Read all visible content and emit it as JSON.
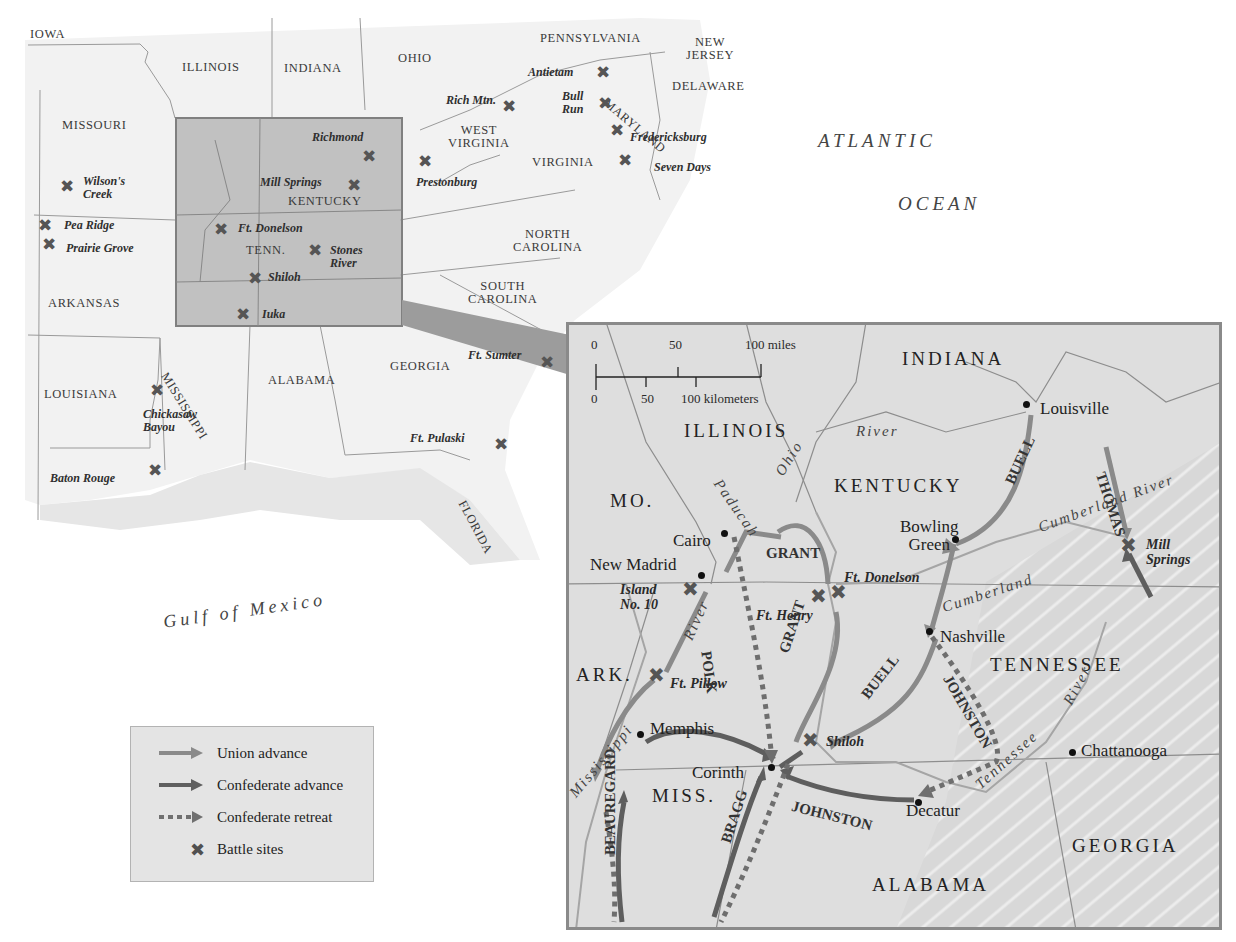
{
  "overview_map": {
    "states": [
      {
        "id": "iowa",
        "label": "IOWA",
        "x": 30,
        "y": 28
      },
      {
        "id": "illinois",
        "label": "ILLINOIS",
        "x": 182,
        "y": 61
      },
      {
        "id": "indiana",
        "label": "INDIANA",
        "x": 284,
        "y": 62
      },
      {
        "id": "ohio",
        "label": "OHIO",
        "x": 398,
        "y": 52
      },
      {
        "id": "pennsylvania",
        "label": "PENNSYLVANIA",
        "x": 540,
        "y": 32
      },
      {
        "id": "new-jersey",
        "label": "NEW\nJERSEY",
        "x": 686,
        "y": 36
      },
      {
        "id": "delaware",
        "label": "DELAWARE",
        "x": 672,
        "y": 80
      },
      {
        "id": "missouri",
        "label": "MISSOURI",
        "x": 62,
        "y": 119
      },
      {
        "id": "west-virginia",
        "label": "WEST\nVIRGINIA",
        "x": 448,
        "y": 124
      },
      {
        "id": "virginia",
        "label": "VIRGINIA",
        "x": 532,
        "y": 156
      },
      {
        "id": "kentucky",
        "label": "KENTUCKY",
        "x": 288,
        "y": 195
      },
      {
        "id": "tenn",
        "label": "TENN.",
        "x": 246,
        "y": 244
      },
      {
        "id": "north-carolina",
        "label": "NORTH\nCAROLINA",
        "x": 513,
        "y": 228
      },
      {
        "id": "south-carolina",
        "label": "SOUTH\nCAROLINA",
        "x": 468,
        "y": 280
      },
      {
        "id": "arkansas",
        "label": "ARKANSAS",
        "x": 48,
        "y": 297
      },
      {
        "id": "louisiana",
        "label": "LOUISIANA",
        "x": 44,
        "y": 388
      },
      {
        "id": "alabama",
        "label": "ALABAMA",
        "x": 268,
        "y": 374
      },
      {
        "id": "georgia",
        "label": "GEORGIA",
        "x": 390,
        "y": 360
      }
    ],
    "rotated_states": [
      {
        "id": "mississippi",
        "label": "MISSISSIPPI",
        "x": 170,
        "y": 370,
        "rotate": 58
      },
      {
        "id": "maryland",
        "label": "MARYLAND",
        "x": 610,
        "y": 96,
        "rotate": 40
      },
      {
        "id": "florida",
        "label": "FLORIDA",
        "x": 468,
        "y": 498,
        "rotate": 62
      }
    ],
    "battles": [
      {
        "label": "Antietam",
        "x": 528,
        "y": 66,
        "xx": 596,
        "xy": 64
      },
      {
        "label": "Rich Mtn.",
        "x": 446,
        "y": 94,
        "xx": 502,
        "xy": 98
      },
      {
        "label": "Bull\nRun",
        "x": 562,
        "y": 90,
        "xx": 598,
        "xy": 95
      },
      {
        "label": "Fredericksburg",
        "x": 630,
        "y": 131,
        "xx": 610,
        "xy": 122
      },
      {
        "label": "Seven Days",
        "x": 654,
        "y": 161,
        "xx": 618,
        "xy": 152
      },
      {
        "label": "Prestonburg",
        "x": 416,
        "y": 176,
        "xx": 418,
        "xy": 153
      },
      {
        "label": "Richmond",
        "x": 312,
        "y": 131,
        "xx": 362,
        "xy": 148
      },
      {
        "label": "Mill Springs",
        "x": 260,
        "y": 176,
        "xx": 347,
        "xy": 177
      },
      {
        "label": "Wilson's\nCreek",
        "x": 83,
        "y": 175,
        "xx": 60,
        "xy": 178
      },
      {
        "label": "Pea Ridge",
        "x": 64,
        "y": 219,
        "xx": 38,
        "xy": 217
      },
      {
        "label": "Prairie Grove",
        "x": 66,
        "y": 242,
        "xx": 42,
        "xy": 236
      },
      {
        "label": "Ft. Donelson",
        "x": 238,
        "y": 222,
        "xx": 214,
        "xy": 221
      },
      {
        "label": "Stones\nRiver",
        "x": 330,
        "y": 244,
        "xx": 308,
        "xy": 242
      },
      {
        "label": "Shiloh",
        "x": 268,
        "y": 271,
        "xx": 248,
        "xy": 270
      },
      {
        "label": "Iuka",
        "x": 262,
        "y": 308,
        "xx": 236,
        "xy": 306
      },
      {
        "label": "Ft. Sumter",
        "x": 468,
        "y": 349,
        "xx": 540,
        "xy": 354
      },
      {
        "label": "Chickasaw\nBayou",
        "x": 143,
        "y": 408,
        "xx": 150,
        "xy": 382
      },
      {
        "label": "Ft. Pulaski",
        "x": 410,
        "y": 432,
        "xx": 494,
        "xy": 436
      },
      {
        "label": "Baton Rouge",
        "x": 50,
        "y": 472,
        "xx": 148,
        "xy": 462
      }
    ],
    "oceans": [
      {
        "label": "ATLANTIC",
        "x": 818,
        "y": 130
      },
      {
        "label": "OCEAN",
        "x": 898,
        "y": 193
      }
    ],
    "gulf": {
      "label": "Gulf of Mexico"
    }
  },
  "legend": {
    "items": [
      {
        "type": "union",
        "label": "Union advance"
      },
      {
        "type": "confederate",
        "label": "Confederate advance"
      },
      {
        "type": "retreat",
        "label": "Confederate retreat"
      },
      {
        "type": "battle",
        "label": "Battle sites"
      }
    ]
  },
  "inset_map": {
    "scale": {
      "miles_ticks": [
        "0",
        "50",
        "100 miles"
      ],
      "km_ticks": [
        "0",
        "50",
        "100 kilometers"
      ]
    },
    "states": [
      {
        "label": "INDIANA",
        "x": 902,
        "y": 348
      },
      {
        "label": "ILLINOIS",
        "x": 684,
        "y": 420
      },
      {
        "label": "KENTUCKY",
        "x": 834,
        "y": 475
      },
      {
        "label": "MO.",
        "x": 610,
        "y": 490
      },
      {
        "label": "TENNESSEE",
        "x": 990,
        "y": 654
      },
      {
        "label": "ARK.",
        "x": 576,
        "y": 664
      },
      {
        "label": "MISS.",
        "x": 652,
        "y": 785
      },
      {
        "label": "ALABAMA",
        "x": 872,
        "y": 874
      },
      {
        "label": "GEORGIA",
        "x": 1072,
        "y": 835
      }
    ],
    "cities": [
      {
        "label": "Louisville",
        "x": 1040,
        "y": 400,
        "dx": 1026,
        "dy": 404
      },
      {
        "label": "Cairo",
        "x": 673,
        "y": 532,
        "dx": 724,
        "dy": 533
      },
      {
        "label": "Bowling\nGreen",
        "x": 900,
        "y": 518,
        "dx": 955,
        "dy": 539
      },
      {
        "label": "New Madrid",
        "x": 590,
        "y": 556,
        "dx": 701,
        "dy": 575
      },
      {
        "label": "Nashville",
        "x": 940,
        "y": 628,
        "dx": 929,
        "dy": 631
      },
      {
        "label": "Memphis",
        "x": 650,
        "y": 720,
        "dx": 640,
        "dy": 734
      },
      {
        "label": "Corinth",
        "x": 692,
        "y": 764,
        "dx": 771,
        "dy": 767
      },
      {
        "label": "Chattanooga",
        "x": 1081,
        "y": 742,
        "dx": 1072,
        "dy": 752
      },
      {
        "label": "Decatur",
        "x": 906,
        "y": 802,
        "dx": 918,
        "dy": 802
      }
    ],
    "battles": [
      {
        "label": "Mill\nSprings",
        "x": 1146,
        "y": 537,
        "xx": 1120,
        "xy": 537
      },
      {
        "label": "Island\nNo. 10",
        "x": 620,
        "y": 582,
        "xx": 682,
        "xy": 581
      },
      {
        "label": "Ft. Donelson",
        "x": 844,
        "y": 570,
        "xx": 830,
        "xy": 584
      },
      {
        "label": "Ft. Henry",
        "x": 756,
        "y": 608,
        "xx": 810,
        "xy": 588
      },
      {
        "label": "Ft. Pillow",
        "x": 670,
        "y": 676,
        "xx": 648,
        "xy": 667
      },
      {
        "label": "Shiloh",
        "x": 826,
        "y": 734,
        "xx": 802,
        "xy": 732
      }
    ],
    "generals": [
      {
        "label": "GRANT",
        "x": 766,
        "y": 545,
        "rotate": 0
      },
      {
        "label": "BUELL",
        "x": 1002,
        "y": 480,
        "rotate": -65
      },
      {
        "label": "THOMAS",
        "x": 1108,
        "y": 470,
        "rotate": 72
      },
      {
        "label": "POLK",
        "x": 714,
        "y": 650,
        "rotate": 82
      },
      {
        "label": "GRANT",
        "x": 776,
        "y": 650,
        "rotate": -72
      },
      {
        "label": "BUELL",
        "x": 858,
        "y": 692,
        "rotate": -52
      },
      {
        "label": "JOHNSTON",
        "x": 954,
        "y": 672,
        "rotate": 60
      },
      {
        "label": "JOHNSTON",
        "x": 794,
        "y": 798,
        "rotate": 14
      },
      {
        "label": "BEAUREGARD",
        "x": 602,
        "y": 855,
        "rotate": -90
      },
      {
        "label": "BRAGG",
        "x": 718,
        "y": 840,
        "rotate": -72
      }
    ],
    "rivers": [
      {
        "label": "Ohio",
        "x": 772,
        "y": 470,
        "rotate": -58
      },
      {
        "label": "River",
        "x": 856,
        "y": 423,
        "rotate": 0
      },
      {
        "label": "Paducah",
        "x": 724,
        "y": 476,
        "rotate": 55
      },
      {
        "label": "Cumberland River",
        "x": 1036,
        "y": 520,
        "rotate": -20
      },
      {
        "label": "Cumberland",
        "x": 940,
        "y": 600,
        "rotate": -18
      },
      {
        "label": "River",
        "x": 680,
        "y": 636,
        "rotate": -66
      },
      {
        "label": "Mississippi",
        "x": 566,
        "y": 790,
        "rotate": -50
      },
      {
        "label": "Tennessee",
        "x": 972,
        "y": 780,
        "rotate": -42
      },
      {
        "label": "River",
        "x": 1060,
        "y": 700,
        "rotate": -62
      }
    ]
  },
  "colors": {
    "land": "#f4f4f4",
    "inset_land": "#dcdcdc",
    "highlight_box": "#9f9f9f",
    "border": "#8c8c8c",
    "arrow_union": "#7a7a7a",
    "arrow_confederate": "#5e5e5e",
    "battle_x": "#555555"
  }
}
